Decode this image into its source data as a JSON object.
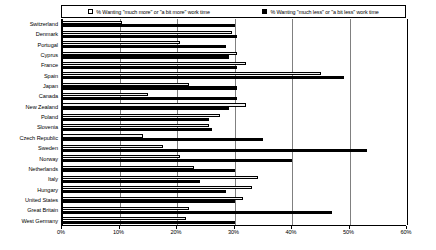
{
  "legend": {
    "entries": [
      {
        "key": "more",
        "label": "% Wanting \"much more\" or \"a bit more\" work time",
        "swatch": "white-square-icon",
        "color": "#ffffff"
      },
      {
        "key": "less",
        "label": "% Wanting \"much less\" or \"a bit less\" work time",
        "swatch": "black-square-icon",
        "color": "#000000"
      }
    ]
  },
  "axis": {
    "x_ticks": [
      "0%",
      "10%",
      "20%",
      "30%",
      "40%",
      "50%",
      "60%"
    ],
    "x_min": 0,
    "x_max": 60
  },
  "chart_data": {
    "type": "bar",
    "orientation": "horizontal",
    "title": "",
    "subtitle": "",
    "xlabel": "",
    "ylabel": "",
    "xlim": [
      0,
      60
    ],
    "grid": true,
    "legend_position": "top",
    "tick_labels": [
      "0%",
      "10%",
      "20%",
      "30%",
      "40%",
      "50%",
      "60%"
    ],
    "categories": [
      "Switzerland",
      "Denmark",
      "Portugal",
      "Cyprus",
      "France",
      "Spain",
      "Japan",
      "Canada",
      "New Zealand",
      "Poland",
      "Slovenia",
      "Czech Republic",
      "Sweden",
      "Norway",
      "Netherlands",
      "Italy",
      "Hungary",
      "United States",
      "Great Britain",
      "West Germany"
    ],
    "series": [
      {
        "name": "% Wanting \"much more\" or \"a bit more\" work time",
        "color": "#ffffff",
        "values": [
          10.5,
          29.5,
          20.5,
          30.5,
          32.0,
          45.0,
          22.0,
          15.0,
          32.0,
          27.5,
          25.5,
          14.0,
          17.5,
          20.5,
          23.0,
          34.0,
          33.0,
          31.5,
          22.0,
          21.5
        ]
      },
      {
        "name": "% Wanting \"much less\" or \"a bit less\" work time",
        "color": "#000000",
        "values": [
          30.0,
          30.5,
          28.5,
          29.0,
          30.5,
          49.0,
          30.5,
          30.5,
          29.0,
          25.5,
          26.0,
          35.0,
          53.0,
          40.0,
          30.0,
          24.0,
          28.5,
          30.0,
          47.0,
          30.0
        ]
      }
    ]
  }
}
